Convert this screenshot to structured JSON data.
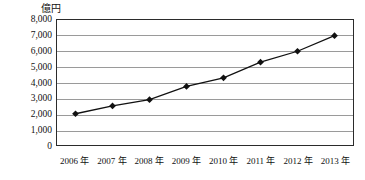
{
  "chart_data": {
    "type": "line",
    "title": "",
    "xlabel": "",
    "ylabel": "億円",
    "categories": [
      "2006 年",
      "2007 年",
      "2008 年",
      "2009 年",
      "2010 年",
      "2011 年",
      "2012 年",
      "2013 年"
    ],
    "values": [
      2000,
      2500,
      2900,
      3750,
      4300,
      5300,
      6000,
      7000
    ],
    "series": [
      {
        "name": "",
        "values": [
          2000,
          2500,
          2900,
          3750,
          4300,
          5300,
          6000,
          7000
        ]
      }
    ],
    "ylim": [
      0,
      8000
    ],
    "ytick_labels": [
      "8,000",
      "7,000",
      "6,000",
      "5,000",
      "4,000",
      "3,000",
      "2,000",
      "1,000",
      "0"
    ],
    "ytick_values": [
      8000,
      7000,
      6000,
      5000,
      4000,
      3000,
      2000,
      1000,
      0
    ],
    "grid": true,
    "grid_orientation": "horizontal",
    "legend": false,
    "legend_position": "none",
    "marker": "diamond",
    "line_color": "#111111",
    "marker_color": "#111111",
    "grid_color": "#9a9a9a",
    "frame_color": "#2b2b2b",
    "background_color": "#ffffff"
  }
}
